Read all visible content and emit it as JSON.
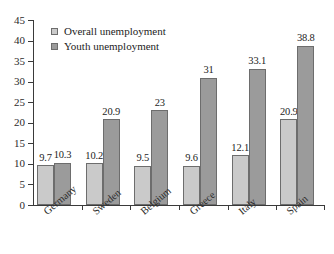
{
  "chart_data": {
    "type": "bar",
    "title": "",
    "subtitle": "",
    "xlabel": "",
    "ylabel": "",
    "ylim": [
      0,
      45
    ],
    "ytick_step": 5,
    "yticks": [
      0,
      5,
      10,
      15,
      20,
      25,
      30,
      35,
      40,
      45
    ],
    "grid": false,
    "legend_position": "top-left-inside",
    "categories": [
      "Germany",
      "Sweden",
      "Belgium",
      "Greece",
      "Italy",
      "Spain"
    ],
    "series": [
      {
        "name": "Overall unemployment",
        "color": "#cacaca",
        "values": [
          9.7,
          10.2,
          9.5,
          9.6,
          12.1,
          20.9
        ],
        "labels": [
          "9.7",
          "10.2",
          "9.5",
          "9.6",
          "12.1",
          "20.9"
        ]
      },
      {
        "name": "Youth unemployment",
        "color": "#9b9b9b",
        "values": [
          10.3,
          20.9,
          23,
          31,
          33.1,
          38.8
        ],
        "labels": [
          "10.3",
          "20.9",
          "23",
          "31",
          "33.1",
          "38.8"
        ]
      }
    ]
  },
  "legend": {
    "items": [
      {
        "label": "Overall unemployment",
        "swatch": "#cacaca"
      },
      {
        "label": "Youth unemployment",
        "swatch": "#9b9b9b"
      }
    ]
  },
  "axis": {
    "y_labels": [
      "45",
      "40",
      "35",
      "30",
      "25",
      "20",
      "15",
      "10",
      "5",
      "0"
    ],
    "x_labels": [
      "Germany",
      "Sweden",
      "Belgium",
      "Greece",
      "Italy",
      "Spain"
    ]
  },
  "colors": {
    "series_overall": "#cacaca",
    "series_youth": "#9b9b9b",
    "bar_border": "#6d6d6d",
    "axis": "#3a3a3a",
    "text": "#1d1d1d",
    "background": "#ffffff"
  }
}
